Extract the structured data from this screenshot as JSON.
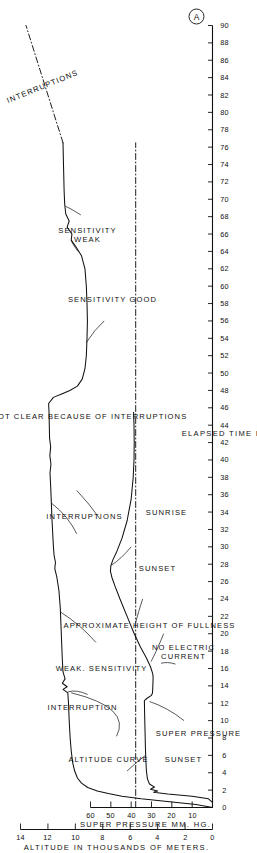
{
  "figure": {
    "corner_mark": "A",
    "orientation": "rotated-90-ccw"
  },
  "chart_data": {
    "type": "line",
    "title": "",
    "xlabel": "ELAPSED  TIME  IN  HOURS",
    "ylabel": "ALTITUDE  IN  THOUSANDS  OF  METERS.",
    "ylabel2": "SUPER  PRESSURE  MM. HG.",
    "xlim": [
      0,
      90
    ],
    "ylim": [
      0,
      14
    ],
    "ylim2": [
      0,
      60
    ],
    "grid": false,
    "legend": "none",
    "xticks": [
      0,
      2,
      4,
      6,
      8,
      10,
      12,
      14,
      16,
      18,
      20,
      22,
      24,
      26,
      28,
      30,
      32,
      34,
      36,
      38,
      40,
      42,
      44,
      46,
      48,
      50,
      52,
      54,
      56,
      58,
      60,
      62,
      64,
      66,
      68,
      70,
      72,
      74,
      76,
      78,
      80,
      82,
      84,
      86,
      88,
      90
    ],
    "xticklabels": [
      "0",
      "2",
      "4",
      "6",
      "8",
      "10",
      "12",
      "14",
      "16",
      "18",
      "20",
      "22",
      "24",
      "26",
      "28",
      "30",
      "32",
      "34",
      "36",
      "38",
      "40",
      "42",
      "44",
      "46",
      "48",
      "50",
      "52",
      "54",
      "56",
      "58",
      "60",
      "62",
      "64",
      "66",
      "68",
      "70",
      "72",
      "74",
      "76",
      "78",
      "80",
      "82",
      "84",
      "86",
      "88",
      "90"
    ],
    "yticks": [
      0,
      2,
      4,
      6,
      8,
      10,
      12,
      14
    ],
    "yticklabels": [
      "0",
      "2",
      "4",
      "6",
      "8",
      "10",
      "12",
      "14"
    ],
    "yticks2": [
      10,
      20,
      30,
      40,
      50,
      60
    ],
    "yticklabels2": [
      "10",
      "20",
      "30",
      "40",
      "50",
      "60"
    ],
    "series": [
      {
        "name": "ALTITUDE CURVE",
        "style": "solid",
        "axis": "altitude",
        "points": [
          [
            0.0,
            0.0
          ],
          [
            0.35,
            1.2
          ],
          [
            0.7,
            3.3
          ],
          [
            1.0,
            5.2
          ],
          [
            1.3,
            6.6
          ],
          [
            1.6,
            7.6
          ],
          [
            1.9,
            8.4
          ],
          [
            2.3,
            9.1
          ],
          [
            2.8,
            9.55
          ],
          [
            3.4,
            9.85
          ],
          [
            4.2,
            10.05
          ],
          [
            5.2,
            10.2
          ],
          [
            6.5,
            10.3
          ],
          [
            8.0,
            10.38
          ],
          [
            10.0,
            10.45
          ],
          [
            12.0,
            10.5
          ],
          [
            13.2,
            10.55
          ],
          [
            13.6,
            10.9
          ],
          [
            13.9,
            10.6
          ],
          [
            14.3,
            10.95
          ],
          [
            14.8,
            10.75
          ],
          [
            15.6,
            10.9
          ],
          [
            17.0,
            10.95
          ],
          [
            19.0,
            11.0
          ],
          [
            21.0,
            11.05
          ],
          [
            23.0,
            11.1
          ],
          [
            25.0,
            11.2
          ],
          [
            26.5,
            11.35
          ],
          [
            27.5,
            11.5
          ],
          [
            28.2,
            11.45
          ],
          [
            29.0,
            11.55
          ],
          [
            30.0,
            11.6
          ],
          [
            31.5,
            11.65
          ],
          [
            33.0,
            11.7
          ],
          [
            35.0,
            11.75
          ],
          [
            37.0,
            11.8
          ],
          [
            38.5,
            11.85
          ],
          [
            39.5,
            11.78
          ],
          [
            40.5,
            11.86
          ],
          [
            41.5,
            11.8
          ],
          [
            42.5,
            11.88
          ],
          [
            44.0,
            11.9
          ],
          [
            45.5,
            11.92
          ],
          [
            46.5,
            11.95
          ],
          [
            47.2,
            11.6
          ],
          [
            47.6,
            11.0
          ],
          [
            48.0,
            10.4
          ],
          [
            48.5,
            9.85
          ],
          [
            49.3,
            9.5
          ],
          [
            50.5,
            9.3
          ],
          [
            52.0,
            9.2
          ],
          [
            54.0,
            9.15
          ],
          [
            56.0,
            9.12
          ],
          [
            58.0,
            9.15
          ],
          [
            60.0,
            9.2
          ],
          [
            62.0,
            9.3
          ],
          [
            63.5,
            9.55
          ],
          [
            64.5,
            9.95
          ],
          [
            65.3,
            10.3
          ],
          [
            66.0,
            10.25
          ],
          [
            66.8,
            10.6
          ],
          [
            67.5,
            10.45
          ],
          [
            68.3,
            10.7
          ],
          [
            69.5,
            10.78
          ],
          [
            71.0,
            10.82
          ],
          [
            73.0,
            10.85
          ],
          [
            75.0,
            10.88
          ],
          [
            76.5,
            10.9
          ]
        ]
      },
      {
        "name": "APPROXIMATE HEIGHT OF FULLNESS",
        "style": "dash-dot",
        "axis": "altitude",
        "points": [
          [
            0.0,
            5.6
          ],
          [
            76.5,
            5.6
          ]
        ]
      },
      {
        "name": "INTERRUPTIONS",
        "style": "dash-dot",
        "axis": "altitude",
        "points": [
          [
            76.5,
            10.9
          ],
          [
            90.0,
            13.6
          ]
        ]
      },
      {
        "name": "SUPER PRESSURE",
        "style": "solid",
        "axis": "pressure",
        "points": [
          [
            0.0,
            0.0
          ],
          [
            0.6,
            0.0
          ],
          [
            1.0,
            2.0
          ],
          [
            1.3,
            10.0
          ],
          [
            1.55,
            22.0
          ],
          [
            1.75,
            29.0
          ],
          [
            1.9,
            27.0
          ],
          [
            2.1,
            30.5
          ],
          [
            2.35,
            28.5
          ],
          [
            2.7,
            31.0
          ],
          [
            3.3,
            32.0
          ],
          [
            4.2,
            32.5
          ],
          [
            5.5,
            32.8
          ],
          [
            7.0,
            33.0
          ],
          [
            9.0,
            33.2
          ],
          [
            11.0,
            33.4
          ],
          [
            12.3,
            33.5
          ],
          [
            12.6,
            32.0
          ],
          [
            12.9,
            30.0
          ],
          [
            13.2,
            29.5
          ],
          [
            14.2,
            29.3
          ],
          [
            15.0,
            29.2
          ],
          [
            15.4,
            29.4
          ],
          [
            16.2,
            30.5
          ],
          [
            17.2,
            32.5
          ],
          [
            18.5,
            35.5
          ],
          [
            20.0,
            38.5
          ],
          [
            22.0,
            42.0
          ],
          [
            24.0,
            45.5
          ],
          [
            25.5,
            48.0
          ],
          [
            26.5,
            49.5
          ],
          [
            27.2,
            50.2
          ],
          [
            27.8,
            50.0
          ],
          [
            28.5,
            49.0
          ],
          [
            29.5,
            47.0
          ],
          [
            31.0,
            44.5
          ],
          [
            33.0,
            42.0
          ],
          [
            35.5,
            40.0
          ],
          [
            38.0,
            39.0
          ],
          [
            40.0,
            38.6
          ],
          [
            42.0,
            38.5
          ],
          [
            44.0,
            38.6
          ],
          [
            45.5,
            38.8
          ]
        ]
      }
    ],
    "annotations": [
      {
        "text": "ALTITUDE  CURVE",
        "x": 5.5,
        "y": 7.6
      },
      {
        "text": "INTERRUPTION",
        "x": 11.5,
        "y": 9.5
      },
      {
        "text": "WEAK.  SENSITIVITY",
        "x": 16.0,
        "y": 8.1
      },
      {
        "text": "INTERRUPTIONS",
        "x": 33.5,
        "y": 9.3
      },
      {
        "text": "SIGNALS  NOT  CLEAR  BECAUSE  OF  INTERRUPTIONS",
        "x": 45.0,
        "y": 10.6
      },
      {
        "text": "SENSITIVITY\nWEAK",
        "x": 66.0,
        "y": 9.1
      },
      {
        "text": "SENSITIVITY  GOOD",
        "x": 58.5,
        "y": 7.3
      },
      {
        "text": "INTERRUPTIONS",
        "x": 83.0,
        "y": 12.4
      },
      {
        "text": "APPROXIMATE  HEIGHT  OF  FULLNESS",
        "x": 21.0,
        "y": 4.6
      },
      {
        "text": "SUNSET",
        "x": 5.5,
        "y": 2.1
      },
      {
        "text": "SUPER  PRESSURE",
        "x": 8.5,
        "y": 1.05
      },
      {
        "text": "NO  ELECTRIC\nCURRENT",
        "x": 18.0,
        "y": 2.15
      },
      {
        "text": "SUNSET",
        "x": 27.5,
        "y": 4.0
      },
      {
        "text": "SUNRISE",
        "x": 34.0,
        "y": 3.35
      }
    ]
  }
}
